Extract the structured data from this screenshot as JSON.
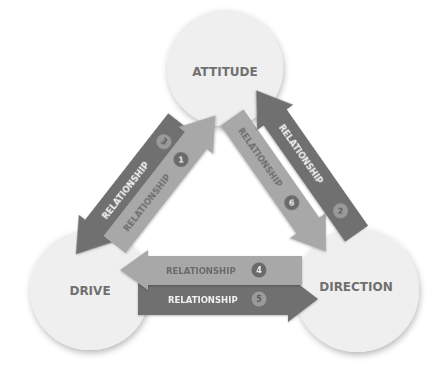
{
  "nodes": {
    "attitude": {
      "label": "ATTITUDE"
    },
    "drive": {
      "label": "DRIVE"
    },
    "direction": {
      "label": "DIRECTION"
    }
  },
  "relationships": [
    {
      "id": 1,
      "label": "RELATIONSHIP",
      "number": "1",
      "from": "DRIVE",
      "to": "ATTITUDE",
      "shade": "light"
    },
    {
      "id": 2,
      "label": "RELATIONSHIP",
      "number": "2",
      "from": "DIRECTION",
      "to": "ATTITUDE",
      "shade": "dark"
    },
    {
      "id": 3,
      "label": "RELATIONSHIP",
      "number": "3",
      "from": "ATTITUDE",
      "to": "DRIVE",
      "shade": "dark"
    },
    {
      "id": 4,
      "label": "RELATIONSHIP",
      "number": "4",
      "from": "DIRECTION",
      "to": "DRIVE",
      "shade": "light"
    },
    {
      "id": 5,
      "label": "RELATIONSHIP",
      "number": "5",
      "from": "DRIVE",
      "to": "DIRECTION",
      "shade": "dark"
    },
    {
      "id": 6,
      "label": "RELATIONSHIP",
      "number": "6",
      "from": "ATTITUDE",
      "to": "DIRECTION",
      "shade": "light"
    }
  ],
  "colors": {
    "dark_arrow": "#707070",
    "light_arrow": "#a9a9a9",
    "circle_fill": "#efefef",
    "node_text": "#707070"
  }
}
